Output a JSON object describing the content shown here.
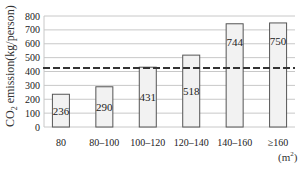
{
  "chart_data": {
    "type": "bar",
    "title": "",
    "xlabel": "(m²)",
    "ylabel": "CO2 emission(kg/person)",
    "categories": [
      "80",
      "80–100",
      "100–120",
      "120–140",
      "140–160",
      "≥160"
    ],
    "values": [
      236,
      290,
      431,
      518,
      744,
      750
    ],
    "data_labels": [
      "236",
      "290",
      "431",
      "518",
      "744",
      "750"
    ],
    "ylim": [
      0,
      800
    ],
    "yticks": [
      0,
      100,
      200,
      300,
      400,
      500,
      600,
      700,
      800
    ],
    "ytick_labels": [
      "0",
      "100",
      "200",
      "300",
      "400",
      "500",
      "600",
      "700",
      "800"
    ],
    "grid": true,
    "reference_line": {
      "style": "dashed",
      "value": 425
    },
    "legend": null
  },
  "labels": {
    "ylabel_prefix": "CO",
    "ylabel_sub": "2",
    "ylabel_suffix": " emission(kg/person)",
    "unit_prefix": "(m",
    "unit_sup": "2",
    "unit_suffix": ")"
  },
  "colors": {
    "bar_fill": "#f2f2f2",
    "bar_stroke": "#555555",
    "grid": "#c8c8c8",
    "reference_line": "#333333",
    "text": "#222222"
  }
}
